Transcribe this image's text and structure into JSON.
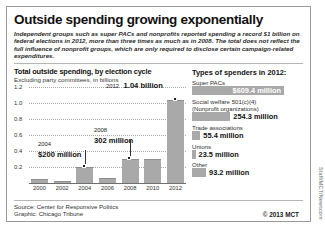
{
  "headline": "Outside spending growing exponentially",
  "deck": "Independent groups such as super PACs and nonprofits reported spending a record $1 billion on federal elections in 2012, more than three times as much as in 2008. The total does not reflect the full influence of nonprofit groups, which are only required to disclose certain campaign-related expenditures.",
  "chart_section": {
    "title": "Total outside spending, by election cycle",
    "subtitle": "Excluding party committees, in billions"
  },
  "spenders_section": {
    "title": "Types of spenders in 2012:"
  },
  "footer": {
    "source": "Source: Center for Responsive Politics",
    "graphic": "Graphic: Chicago Tribune",
    "copyright": "© 2013 MCT",
    "credit": "Staff/MCT/Newscom"
  },
  "colors": {
    "bar": "#a9a9a9",
    "axis": "#6f6f6f",
    "grid": "#a8a8a8",
    "text": "#111111",
    "frame": "#9a9a9a"
  },
  "chart_data": {
    "type": "bar",
    "title": "Total outside spending, by election cycle",
    "subtitle": "Excluding party committees, in billions",
    "xlabel": "",
    "ylabel": "Billions of dollars",
    "categories": [
      "2000",
      "2002",
      "2004",
      "2006",
      "2008",
      "2010",
      "2012"
    ],
    "values": [
      0.05,
      0.03,
      0.2,
      0.07,
      0.302,
      0.3,
      1.04
    ],
    "ylim": [
      0,
      1.2
    ],
    "yticks": [
      "0.2",
      "0.4",
      "0.6",
      "0.8",
      "1.0",
      "1.2"
    ],
    "ytick_values": [
      0.2,
      0.4,
      0.6,
      0.8,
      1.0,
      1.2
    ],
    "grid": true,
    "legend": "none",
    "annotations": [
      {
        "category": "2004",
        "year": "2004",
        "value_label": "$200 million"
      },
      {
        "category": "2008",
        "year": "2008",
        "value_label": "302 million"
      },
      {
        "category": "2012",
        "year": "2012",
        "value_label": "1.04 billion"
      }
    ]
  },
  "spenders_chart": {
    "type": "bar",
    "title": "Types of spenders in 2012:",
    "orientation": "horizontal",
    "unit": "millions of dollars",
    "items": [
      {
        "label": "Super PACs",
        "sublabel": "",
        "value": 609.4,
        "value_label": "$609.4 million",
        "bar_pct": 100,
        "label_inside": true
      },
      {
        "label": "Social welfare 501(c)(4)",
        "sublabel": "(Nonprofit organizations)",
        "value": 254.3,
        "value_label": "254.3 million",
        "bar_pct": 41.7,
        "label_inside": false
      },
      {
        "label": "Trade associations",
        "sublabel": "",
        "value": 55.4,
        "value_label": "55.4 million",
        "bar_pct": 9.1,
        "label_inside": false
      },
      {
        "label": "Unions",
        "sublabel": "",
        "value": 23.5,
        "value_label": "23.5 million",
        "bar_pct": 3.9,
        "label_inside": false
      },
      {
        "label": "Other",
        "sublabel": "",
        "value": 93.2,
        "value_label": "93.2 million",
        "bar_pct": 15.3,
        "label_inside": false
      }
    ]
  }
}
